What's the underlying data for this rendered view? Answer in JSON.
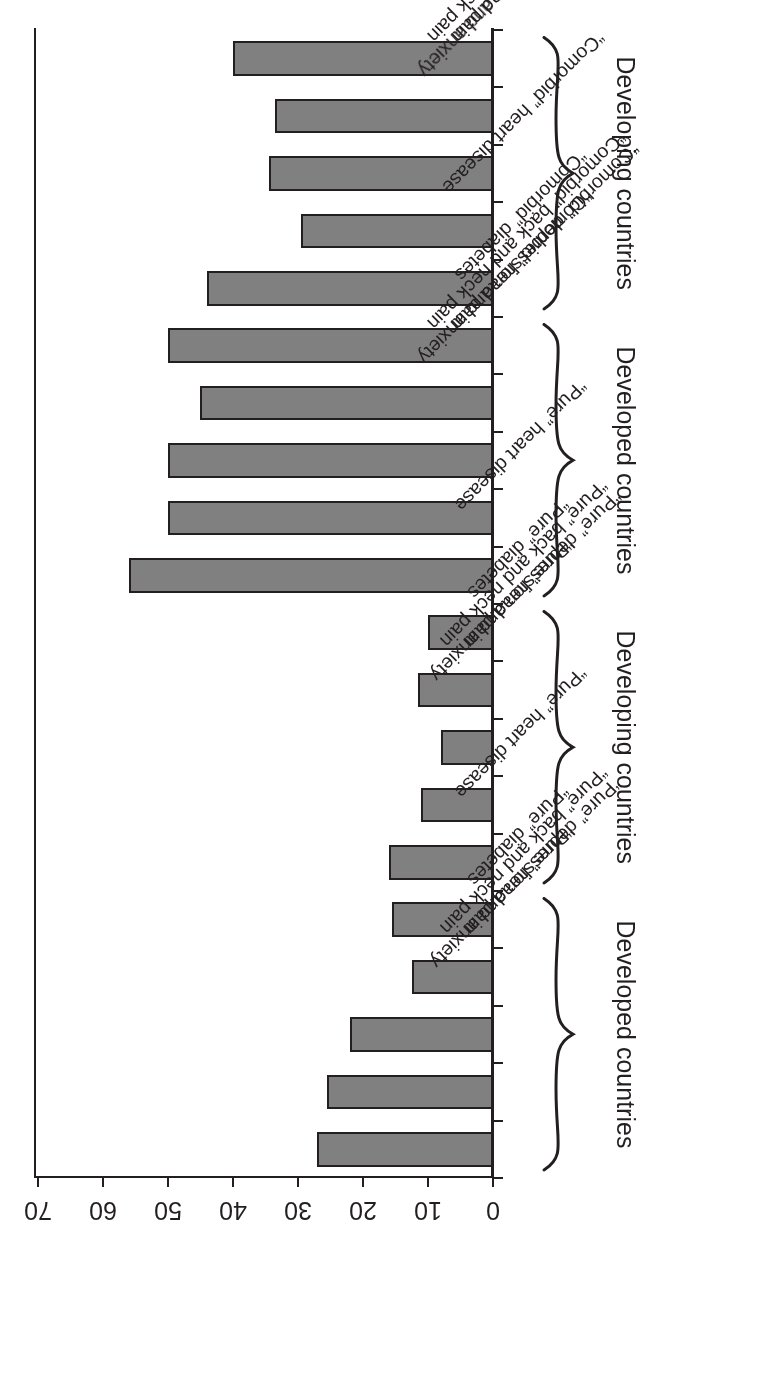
{
  "chart_data": {
    "type": "bar",
    "orientation": "horizontal",
    "title": "",
    "xlabel": "",
    "ylabel": "",
    "xlim": [
      0,
      70
    ],
    "tick_labels": [
      "0",
      "10",
      "20",
      "30",
      "40",
      "50",
      "60",
      "70"
    ],
    "tick_values": [
      0,
      10,
      20,
      30,
      40,
      50,
      60,
      70
    ],
    "grid": false,
    "legend": "none",
    "bar_color": "#808080",
    "bar_edge_color": "#231f20",
    "rotation_note": "entire figure is printed rotated 180 degrees",
    "categories": [
      "“Pure” depression and anxiety",
      "“Pure” back and neck pain",
      "“Pure” head pain",
      "“Pure” diabetes",
      "“Pure” heart disease",
      "“Pure” depression and anxiety",
      "“Pure” back and neck pain",
      "“Pure” head pain",
      "“Pure” diabetes",
      "“Pure” heart disease",
      "“Comorbid” depression and anxiety",
      "“Comorbid” back and neck pain",
      "“Comorbid” head pain",
      "“Comorbid” diabetes",
      "“Comorbid” heart disease",
      "“Comorbid” depression and anxiety",
      "“Comorbid” back and neck pain",
      "“Comorbid” head pain",
      "“Comorbid” diabetes",
      "“Comorbid” heart disease"
    ],
    "values": [
      27,
      25.5,
      22,
      12.5,
      15.5,
      16,
      11,
      8,
      11.5,
      10,
      56,
      50,
      50,
      45,
      50,
      44,
      29.5,
      34.5,
      33.5,
      40
    ],
    "groups": [
      {
        "label": "Developed countries",
        "start_index": 0,
        "end_index": 4
      },
      {
        "label": "Developing countries",
        "start_index": 5,
        "end_index": 9
      },
      {
        "label": "Developed countries",
        "start_index": 10,
        "end_index": 14
      },
      {
        "label": "Developing countries",
        "start_index": 15,
        "end_index": 19
      }
    ]
  }
}
